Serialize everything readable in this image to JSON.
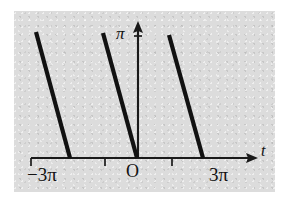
{
  "figure": {
    "name": "sawtooth-linear-periodic-graph",
    "background_color": "#dcdcdc",
    "page_color": "#ffffff",
    "ink_color": "#111111"
  },
  "labels": {
    "y_axis_value": "π",
    "origin": "O",
    "x_tick_left": "−3π",
    "x_tick_right": "3π",
    "x_axis_name": "t"
  },
  "chart_data": {
    "type": "line",
    "title": "",
    "xlabel": "t",
    "ylabel": "π",
    "grid": false,
    "legend": null,
    "xlim": [
      -4.2,
      4.6
    ],
    "ylim": [
      0,
      1.25
    ],
    "x_tick_labels": [
      "−3π",
      "3π"
    ],
    "x_tick_values": [
      -3,
      3
    ],
    "x_tick_positions_pi": [
      -3,
      -1,
      1,
      3
    ],
    "y_tick_labels": [
      "π"
    ],
    "y_tick_values": [
      1
    ],
    "annotations": [
      "O"
    ],
    "series": [
      {
        "name": "segment-1",
        "x": [
          -3.6,
          -2.0
        ],
        "y": [
          1.0,
          0.0
        ]
      },
      {
        "name": "segment-2",
        "x": [
          -1.6,
          0.0
        ],
        "y": [
          1.0,
          0.0
        ]
      },
      {
        "name": "segment-3",
        "x": [
          0.4,
          2.0
        ],
        "y": [
          1.0,
          0.0
        ]
      }
    ],
    "segments_pixel": [
      {
        "name": "segment-1",
        "x1": 36,
        "y1": 32,
        "x2": 70,
        "y2": 158
      },
      {
        "name": "segment-2",
        "x1": 103,
        "y1": 33,
        "x2": 137,
        "y2": 158
      },
      {
        "name": "segment-3",
        "x1": 169,
        "y1": 35,
        "x2": 203,
        "y2": 158
      }
    ],
    "axes_pixel": {
      "x_axis": {
        "x1": 31,
        "y": 158,
        "x2": 258
      },
      "y_axis": {
        "x": 138,
        "y1": 22,
        "y2": 158
      },
      "ticks_x": [
        31,
        105,
        172
      ],
      "tick_y_pi": 36
    }
  }
}
